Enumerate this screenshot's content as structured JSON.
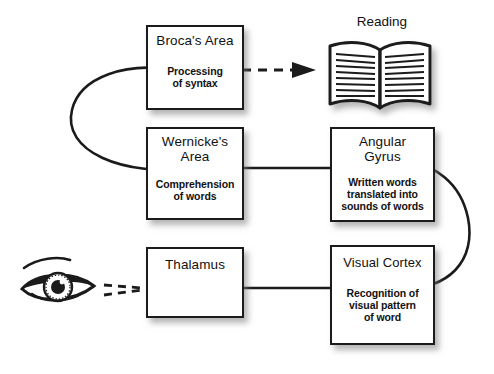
{
  "diagram": {
    "colors": {
      "ink": "#1b1b1b",
      "background": "#ffffff",
      "shadow": "#9a9a9a"
    },
    "nodes": [
      {
        "id": "brocas-area",
        "title": "Broca's Area",
        "description": "Processing\nof syntax",
        "desc_line1": "Processing",
        "desc_line2": "of syntax",
        "neuron_direction": "left"
      },
      {
        "id": "wernickes-area",
        "title": "Wernicke's\nArea",
        "title_line1": "Wernicke's",
        "title_line2": "Area",
        "description": "Comprehension\nof words",
        "desc_line1": "Comprehension",
        "desc_line2": "of words",
        "neuron_direction": "right"
      },
      {
        "id": "angular-gyrus",
        "title": "Angular\nGyrus",
        "title_line1": "Angular",
        "title_line2": "Gyrus",
        "description": "Written words\ntranslated into\nsounds of words",
        "desc_line1": "Written words",
        "desc_line2": "translated into",
        "desc_line3": "sounds of words",
        "neuron_direction": "right"
      },
      {
        "id": "thalamus",
        "title": "Thalamus",
        "description": "",
        "neuron_direction": "left"
      },
      {
        "id": "visual-cortex",
        "title": "Visual Cortex",
        "description": "Recognition of\nvisual pattern\nof word",
        "desc_line1": "Recognition of",
        "desc_line2": "visual pattern",
        "desc_line3": "of word",
        "neuron_direction": "left"
      }
    ],
    "reading": {
      "label": "Reading",
      "icon": "open-book-icon"
    },
    "eye": {
      "icon": "eye-icon",
      "label": ""
    },
    "connections": [
      {
        "from": "brocas-area",
        "to": "reading",
        "style": "dashed",
        "arrow": true
      },
      {
        "from": "wernickes-area",
        "to": "brocas-area",
        "style": "solid-curve",
        "arrow": true
      },
      {
        "from": "wernickes-area",
        "to": "angular-gyrus",
        "style": "solid-line",
        "arrow": true
      },
      {
        "from": "visual-cortex",
        "to": "angular-gyrus",
        "style": "solid-curve",
        "arrow": true
      },
      {
        "from": "visual-cortex",
        "to": "thalamus",
        "style": "solid-line",
        "arrow": true
      },
      {
        "from": "eye",
        "to": "thalamus",
        "style": "dashed",
        "arrow": true
      }
    ]
  }
}
